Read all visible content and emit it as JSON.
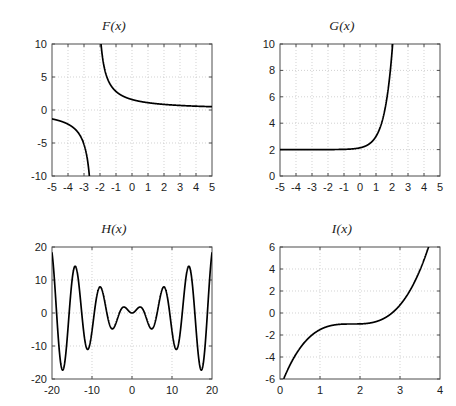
{
  "figure": {
    "title": "",
    "background": "#ffffff",
    "line_color": "#000000",
    "grid_color": "#bfbfbf",
    "axis_color": "#4d4d4d",
    "text_color": "#1c1c1c",
    "rows": 2,
    "cols": 2
  },
  "chart_data": [
    {
      "type": "line",
      "name": "F",
      "title": "F(x)",
      "xlabel": "",
      "ylabel": "",
      "xlim": [
        -5,
        5
      ],
      "ylim": [
        -10,
        10
      ],
      "xticks": [
        -5,
        -4,
        -3,
        -2,
        -1,
        0,
        1,
        2,
        3,
        4,
        5
      ],
      "xticklabels": [
        "-5",
        "-4",
        "-3",
        "-2",
        "-1",
        "0",
        "1",
        "2",
        "3",
        "4",
        "5"
      ],
      "yticks": [
        -10,
        -5,
        0,
        5,
        10
      ],
      "yticklabels": [
        "-10",
        "-5",
        "0",
        "5",
        "10"
      ],
      "grid": true,
      "legend": "none",
      "description": "Hyperbola with a vertical asymptote near x = -2.3 and a horizontal asymptote near y = 0; right branch falls from +10 to about 0.5, left branch falls from about -1.4 to -10.",
      "expression": "3.65 / (x + 2.3)",
      "x": [
        -5.0,
        -4.75,
        -4.5,
        -4.25,
        -4.0,
        -3.75,
        -3.5,
        -3.25,
        -3.0,
        -2.9,
        -2.8,
        -2.7,
        -2.6,
        -2.55,
        -2.5,
        -2.45,
        -2.42,
        -2.1,
        -2.05,
        -2.0,
        -1.9,
        -1.8,
        -1.6,
        -1.4,
        -1.2,
        -1.0,
        -0.5,
        0.0,
        0.5,
        1.0,
        1.5,
        2.0,
        2.5,
        3.0,
        3.5,
        4.0,
        4.5,
        5.0
      ],
      "y": [
        -1.35,
        -1.49,
        -1.66,
        -1.87,
        -2.15,
        -2.52,
        -3.04,
        -3.84,
        -5.21,
        -6.08,
        -7.3,
        -9.12,
        -12.17,
        -14.6,
        -18.25,
        -24.33,
        -29.27,
        18.25,
        14.6,
        12.17,
        9.12,
        7.3,
        5.21,
        4.06,
        3.32,
        2.81,
        2.03,
        1.59,
        1.3,
        1.11,
        0.96,
        0.85,
        0.76,
        0.69,
        0.63,
        0.58,
        0.54,
        0.5
      ]
    },
    {
      "type": "line",
      "name": "G",
      "title": "G(x)",
      "xlabel": "",
      "ylabel": "",
      "xlim": [
        -5,
        5
      ],
      "ylim": [
        0,
        10
      ],
      "xticks": [
        -5,
        -4,
        -3,
        -2,
        -1,
        0,
        1,
        2,
        3,
        4,
        5
      ],
      "xticklabels": [
        "-5",
        "-4",
        "-3",
        "-2",
        "-1",
        "0",
        "1",
        "2",
        "3",
        "4",
        "5"
      ],
      "yticks": [
        0,
        2,
        4,
        6,
        8,
        10
      ],
      "yticklabels": [
        "0",
        "2",
        "4",
        "6",
        "8",
        "10"
      ],
      "grid": true,
      "legend": "none",
      "description": "Exponential growth curve with horizontal asymptote y = 2 on the left, rising steeply and leaving the top of the axes near x = 2.1.",
      "expression": "2 + exp(2*(x - 1))",
      "x": [
        -5.0,
        -4.5,
        -4.0,
        -3.5,
        -3.0,
        -2.5,
        -2.0,
        -1.5,
        -1.0,
        -0.5,
        0.0,
        0.25,
        0.5,
        0.75,
        1.0,
        1.2,
        1.4,
        1.6,
        1.8,
        1.9,
        2.0,
        2.05,
        2.1
      ],
      "y": [
        2.0,
        2.0,
        2.0,
        2.01,
        2.01,
        2.02,
        2.03,
        2.01,
        2.02,
        2.05,
        2.14,
        2.22,
        2.37,
        2.61,
        3.0,
        3.49,
        4.22,
        5.32,
        6.95,
        8.02,
        9.39,
        10.2,
        11.1
      ]
    },
    {
      "type": "line",
      "name": "H",
      "title": "H(x)",
      "xlabel": "",
      "ylabel": "",
      "xlim": [
        -20,
        20
      ],
      "ylim": [
        -20,
        20
      ],
      "xticks": [
        -20,
        -10,
        0,
        10,
        20
      ],
      "xticklabels": [
        "-20",
        "-10",
        "0",
        "10",
        "20"
      ],
      "yticks": [
        -20,
        -10,
        0,
        10,
        20
      ],
      "yticklabels": [
        "-20",
        "-10",
        "0",
        "10",
        "20"
      ],
      "grid": true,
      "legend": "none",
      "description": "Symmetric oscillation whose amplitude grows linearly with |x|; zeros at multiples of pi, small ripples near the origin and large swings reaching about +/-18 near the edges.",
      "expression": "x * sin(x)",
      "peaks": [
        {
          "x": -17.2,
          "y": -17.0
        },
        {
          "x": -14.1,
          "y": 14.0
        },
        {
          "x": -11.0,
          "y": -11.0
        },
        {
          "x": -7.9,
          "y": 7.9
        },
        {
          "x": -4.9,
          "y": -4.8
        },
        {
          "x": -2.0,
          "y": 1.8
        },
        {
          "x": 2.0,
          "y": 1.8
        },
        {
          "x": 4.9,
          "y": -4.8
        },
        {
          "x": 7.9,
          "y": 7.9
        },
        {
          "x": 11.0,
          "y": -11.0
        },
        {
          "x": 14.1,
          "y": 14.0
        },
        {
          "x": 17.2,
          "y": -17.0
        }
      ],
      "endpoints": [
        {
          "x": -20,
          "y": 18.3
        },
        {
          "x": 20,
          "y": 18.3
        }
      ]
    },
    {
      "type": "line",
      "name": "I",
      "title": "I(x)",
      "xlabel": "",
      "ylabel": "",
      "xlim": [
        0,
        4
      ],
      "ylim": [
        -6,
        6
      ],
      "xticks": [
        0,
        1,
        2,
        3,
        4
      ],
      "xticklabels": [
        "0",
        "1",
        "2",
        "3",
        "4"
      ],
      "yticks": [
        -6,
        -4,
        -2,
        0,
        2,
        4,
        6
      ],
      "yticklabels": [
        "-6",
        "-4",
        "-2",
        "0",
        "2",
        "4",
        "6"
      ],
      "grid": true,
      "legend": "none",
      "description": "Monotonic cubic with an inflection plateau near x = 1.8 at y = -1; enters the axes near x = 0.75 at y = -6 and leaves the top near x = 3.1.",
      "expression": "(x - 1.8)^3 - 1",
      "x": [
        0.74,
        0.8,
        0.9,
        1.0,
        1.1,
        1.2,
        1.3,
        1.4,
        1.5,
        1.6,
        1.7,
        1.8,
        1.9,
        2.0,
        2.1,
        2.2,
        2.3,
        2.4,
        2.5,
        2.6,
        2.7,
        2.8,
        2.9,
        3.0,
        3.1
      ],
      "y": [
        -6.2,
        -5.0,
        -3.73,
        -2.81,
        -2.04,
        -1.58,
        -1.25,
        -1.06,
        -1.03,
        -1.01,
        -1.0,
        -1.0,
        -1.0,
        -0.99,
        -0.97,
        -0.94,
        -0.88,
        -0.78,
        -0.66,
        -0.49,
        -0.27,
        0.0,
        0.33,
        0.73,
        1.2
      ]
    }
  ]
}
